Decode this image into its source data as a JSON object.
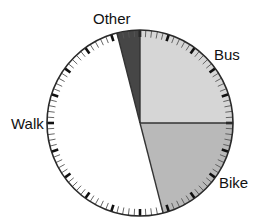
{
  "chart_data": {
    "type": "pie",
    "title": "",
    "start_angle": "12 o'clock",
    "direction": "clockwise",
    "categories": [
      "Bus",
      "Bike",
      "Walk",
      "Other"
    ],
    "values": [
      25,
      21,
      50,
      4
    ],
    "unit": "%",
    "colors": [
      "#d6d6d6",
      "#b9b9b9",
      "#ffffff",
      "#464646"
    ],
    "dial_ticks": {
      "count": 100,
      "major_every": 5
    },
    "legend": "none (direct labels)",
    "labels": [
      {
        "text": "Bus",
        "x": 214,
        "y": 47
      },
      {
        "text": "Bike",
        "x": 219,
        "y": 175
      },
      {
        "text": "Walk",
        "x": 11,
        "y": 116
      },
      {
        "text": "Other",
        "x": 93,
        "y": 11
      }
    ]
  },
  "geometry": {
    "cx": 140,
    "cy": 123,
    "r": 93
  },
  "style": {
    "outline": "#2a2a2a",
    "divider": "#333333",
    "minor_tick": "#555555",
    "major_tick": "#111111"
  }
}
